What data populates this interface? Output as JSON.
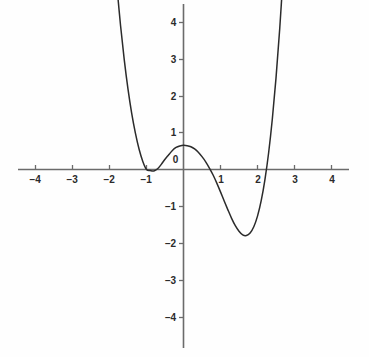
{
  "figure": {
    "background_color": "#fefefe",
    "axis_color": "#6b6b6b",
    "curve_color": "#2b2b2b",
    "label_color": "#2b2b2b",
    "width": 369,
    "height": 357
  },
  "chart_data": {
    "type": "line",
    "title": "",
    "subtitle": "",
    "xlabel": "",
    "ylabel": "",
    "xlim": [
      -4.95,
      5.0
    ],
    "ylim": [
      -4.6,
      4.85
    ],
    "grid": false,
    "legend": null,
    "legend_position": "none",
    "axis_style": "centered-cross",
    "x_ticks": [
      -4,
      -3,
      -2,
      -1,
      1,
      2,
      3,
      4
    ],
    "x_tick_labels": [
      "−4",
      "−3",
      "−2",
      "−1",
      "1",
      "2",
      "3",
      "4"
    ],
    "y_ticks": [
      4,
      3,
      2,
      1,
      -1,
      -2,
      -3,
      -4
    ],
    "y_tick_labels": [
      "4",
      "3",
      "2",
      "1",
      "−1",
      "−2",
      "−3",
      "−4"
    ],
    "origin_label": "0",
    "series": [
      {
        "name": "quartic",
        "equation": "y = 0.25(x+1)^2(x-1.03)(x-2.57)",
        "x": [
          -2.95,
          -2.9,
          -2.8,
          -2.7,
          -2.6,
          -2.5,
          -2.4,
          -2.3,
          -2.2,
          -2.1,
          -2.0,
          -1.9,
          -1.8,
          -1.7,
          -1.6,
          -1.5,
          -1.4,
          -1.3,
          -1.2,
          -1.1,
          -1.0,
          -0.9,
          -0.8,
          -0.7,
          -0.6,
          -0.5,
          -0.4,
          -0.3,
          -0.2,
          -0.1,
          0.0,
          0.1,
          0.2,
          0.3,
          0.4,
          0.5,
          0.6,
          0.7,
          0.8,
          0.9,
          1.0,
          1.1,
          1.2,
          1.3,
          1.4,
          1.5,
          1.6,
          1.7,
          1.8,
          1.9,
          2.0,
          2.1,
          2.2,
          2.3,
          2.4,
          2.5,
          2.6,
          2.7,
          2.8,
          2.9,
          3.0,
          3.05,
          3.1
        ],
        "y": [
          32.96,
          30.97,
          27.25,
          23.86,
          20.77,
          17.97,
          15.44,
          13.16,
          11.11,
          9.29,
          7.67,
          6.24,
          4.99,
          3.91,
          2.98,
          2.19,
          1.53,
          0.99,
          0.55,
          0.22,
          0.0,
          -0.03,
          -0.04,
          0.02,
          0.14,
          0.28,
          0.4,
          0.52,
          0.6,
          0.64,
          0.66,
          0.65,
          0.62,
          0.56,
          0.47,
          0.35,
          0.21,
          0.04,
          -0.15,
          -0.37,
          -0.61,
          -0.86,
          -1.1,
          -1.33,
          -1.53,
          -1.68,
          -1.78,
          -1.8,
          -1.73,
          -1.56,
          -1.27,
          -0.85,
          -0.28,
          0.45,
          1.37,
          2.49,
          3.83,
          5.42,
          7.27,
          9.41,
          11.86,
          13.21,
          14.64
        ],
        "roots": [
          -1.0,
          1.03,
          2.57
        ],
        "double_root": -1.0,
        "local_maximum": {
          "x": 0.25,
          "y": 0.65
        },
        "local_minimum": {
          "x": 1.87,
          "y": -1.35
        },
        "y_intercept": 0.66
      }
    ],
    "annotations": []
  }
}
